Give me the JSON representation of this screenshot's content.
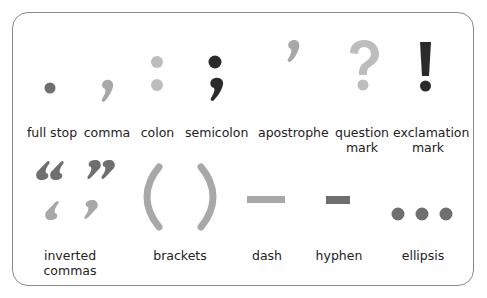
{
  "colors": {
    "dark": "#2b2b2b",
    "mid": "#6f6f6f",
    "light": "#a8a8a8",
    "lighter": "#bdbdbd",
    "border": "#8a8a8a"
  },
  "marks": [
    {
      "name": "full stop",
      "label": "full stop"
    },
    {
      "name": "comma",
      "label": "comma"
    },
    {
      "name": "colon",
      "label": "colon"
    },
    {
      "name": "semicolon",
      "label": "semicolon"
    },
    {
      "name": "apostrophe",
      "label": "apostrophe"
    },
    {
      "name": "question mark",
      "label_line1": "question",
      "label_line2": "mark"
    },
    {
      "name": "exclamation mark",
      "label_line1": "exclamation",
      "label_line2": "mark"
    },
    {
      "name": "inverted commas",
      "label_line1": "inverted",
      "label_line2": "commas"
    },
    {
      "name": "brackets",
      "label": "brackets"
    },
    {
      "name": "dash",
      "label": "dash"
    },
    {
      "name": "hyphen",
      "label": "hyphen"
    },
    {
      "name": "ellipsis",
      "label": "ellipsis"
    }
  ]
}
